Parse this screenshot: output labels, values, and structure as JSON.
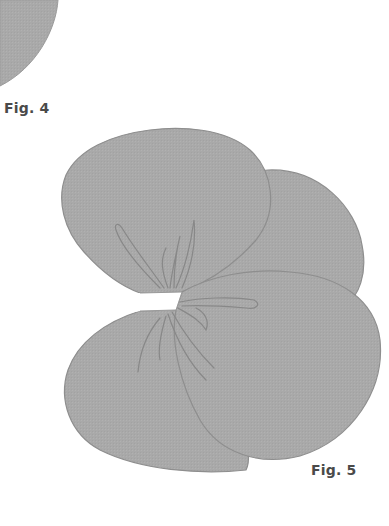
{
  "figures": [
    {
      "label": "Fig. 4",
      "description": "partial rounded petal shape (cropped at top-left)"
    },
    {
      "label": "Fig. 5",
      "description": "four overlapping petals joined at a slit notch, with stamen/vein lines"
    }
  ],
  "colors": {
    "petal_fill": "#a9a9a9",
    "petal_outline": "#8e8e8e",
    "vein_line": "#888888",
    "label_text": "#4a4a4a",
    "background": "#ffffff"
  }
}
